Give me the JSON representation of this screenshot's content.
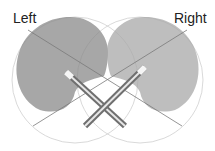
{
  "diagram": {
    "labels": {
      "left": "Left",
      "right": "Right"
    },
    "colors": {
      "left_lobe": "#8a8a8a",
      "right_lobe": "#a8a8a8",
      "circle": "#c8c8c8",
      "axis": "#7a7a7a",
      "mic_body": "#777777",
      "mic_highlight": "#e8e8e8"
    }
  }
}
